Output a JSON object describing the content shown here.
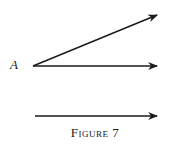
{
  "figure": {
    "point_label": "A",
    "caption": "Figure 7",
    "stroke_color": "#1a1a1a",
    "rays": [
      {
        "name": "upper-ray",
        "from": [
          33,
          66
        ],
        "to": [
          157,
          15
        ]
      },
      {
        "name": "middle-ray",
        "from": [
          33,
          66
        ],
        "to": [
          157,
          66
        ]
      },
      {
        "name": "lower-ray",
        "from": [
          35,
          116
        ],
        "to": [
          157,
          116
        ]
      }
    ]
  }
}
